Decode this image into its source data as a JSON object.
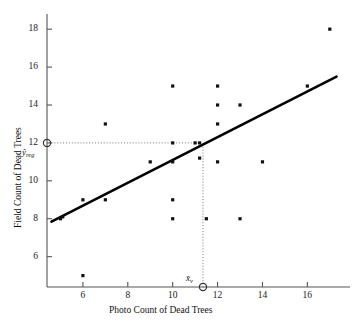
{
  "chart_data": {
    "type": "scatter",
    "title": "",
    "xlabel": "Photo Count of Dead Trees",
    "ylabel": "Field Count of Dead Trees",
    "xlim": [
      4.4,
      17.9
    ],
    "ylim": [
      4.4,
      18.8
    ],
    "xticks": [
      6,
      8,
      10,
      12,
      14,
      16
    ],
    "yticks": [
      6,
      8,
      10,
      12,
      14,
      16,
      18
    ],
    "xtick_labels": [
      "6",
      "8",
      "10",
      "12",
      "14",
      "16"
    ],
    "ytick_labels": [
      "6",
      "8",
      "10",
      "12",
      "14",
      "16",
      "18"
    ],
    "grid": false,
    "legend": "none",
    "points": [
      {
        "x": 5.0,
        "y": 8.0
      },
      {
        "x": 5.1,
        "y": 8.1
      },
      {
        "x": 6.0,
        "y": 9.0
      },
      {
        "x": 6.0,
        "y": 5.0
      },
      {
        "x": 7.0,
        "y": 13.0
      },
      {
        "x": 7.0,
        "y": 9.0
      },
      {
        "x": 9.0,
        "y": 11.0
      },
      {
        "x": 10.0,
        "y": 15.0
      },
      {
        "x": 10.0,
        "y": 12.0
      },
      {
        "x": 10.0,
        "y": 11.0
      },
      {
        "x": 10.0,
        "y": 9.0
      },
      {
        "x": 10.0,
        "y": 8.0
      },
      {
        "x": 11.0,
        "y": 12.0
      },
      {
        "x": 11.2,
        "y": 12.0
      },
      {
        "x": 11.2,
        "y": 11.2
      },
      {
        "x": 11.5,
        "y": 8.0
      },
      {
        "x": 12.0,
        "y": 15.0
      },
      {
        "x": 12.0,
        "y": 14.0
      },
      {
        "x": 12.0,
        "y": 13.0
      },
      {
        "x": 12.0,
        "y": 11.0
      },
      {
        "x": 13.0,
        "y": 14.0
      },
      {
        "x": 13.0,
        "y": 8.0
      },
      {
        "x": 14.0,
        "y": 11.0
      },
      {
        "x": 16.0,
        "y": 15.0
      },
      {
        "x": 17.0,
        "y": 18.0
      }
    ],
    "regression_line": {
      "label": "regression line",
      "x_start": 4.6,
      "y_start": 7.85,
      "x_end": 17.3,
      "y_end": 15.5
    },
    "reference_lines": {
      "horizontal": {
        "label": "y-hat-reg",
        "y": 12.0,
        "x_from": 4.6,
        "x_to": 11.3,
        "style": "dotted"
      },
      "vertical": {
        "label": "x-bar-v",
        "x": 11.35,
        "y_from": 4.4,
        "y_to": 12.0,
        "style": "dotted"
      }
    },
    "annotations": [
      {
        "name": "y-hat-reg",
        "text": "ŷ",
        "subscript": "reg",
        "axis": "y",
        "value": 12.0
      },
      {
        "name": "x-bar-v",
        "text": "x̄",
        "subscript": "v",
        "axis": "x",
        "value": 11.35
      }
    ],
    "marker_color": "#111111",
    "line_color": "#000000",
    "axis_color": "#555555"
  }
}
